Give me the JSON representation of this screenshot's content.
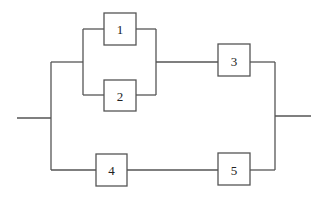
{
  "diagram": {
    "type": "reliability-block-diagram",
    "blocks": [
      {
        "id": "1",
        "label": "1"
      },
      {
        "id": "2",
        "label": "2"
      },
      {
        "id": "3",
        "label": "3"
      },
      {
        "id": "4",
        "label": "4"
      },
      {
        "id": "5",
        "label": "5"
      }
    ],
    "structure": {
      "upper_path": "(1 parallel 2) series 3",
      "lower_path": "4 series 5",
      "overall": "upper_path parallel lower_path"
    },
    "colors": {
      "line": "#555555",
      "text": "#222222",
      "background": "#ffffff"
    }
  }
}
